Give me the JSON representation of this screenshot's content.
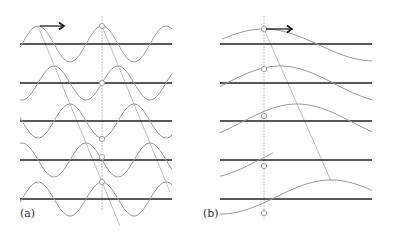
{
  "panels": [
    {
      "label": "(a)",
      "description": "Wave propagation, short wavelength"
    },
    {
      "label": "(b)",
      "description": "Wave propagation, long wavelength"
    }
  ],
  "colors": {
    "axis": "#222222",
    "wave": "#9a9a9a",
    "guide": "#b0b0b0"
  },
  "diagram": {
    "panel_a": {
      "x0": 20,
      "x1": 172,
      "baselines": [
        44,
        83,
        121,
        160,
        199
      ],
      "period": 64,
      "amplitude": 18,
      "phase_step": 16,
      "crest_x": 38,
      "marker_x": 102
    },
    "panel_b": {
      "x0": 220,
      "x1": 372,
      "baselines": [
        44,
        83,
        121,
        160,
        199
      ],
      "period": 220,
      "amplitude": 16,
      "crest_x": 264,
      "marker_x": 264,
      "crest_shift": [
        0,
        16,
        33,
        50,
        66
      ]
    }
  }
}
